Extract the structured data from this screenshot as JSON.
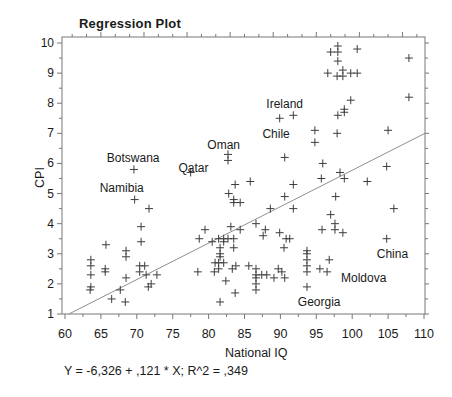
{
  "window": {
    "width": 452,
    "height": 397,
    "background": "#ffffff"
  },
  "chart_data": {
    "type": "scatter",
    "title": "Regression Plot",
    "xlabel": "National IQ",
    "ylabel": "CPI",
    "xlim": [
      60,
      110
    ],
    "ylim": [
      1,
      10
    ],
    "x_ticks": [
      60,
      65,
      70,
      75,
      80,
      85,
      90,
      95,
      100,
      105,
      110
    ],
    "y_ticks": [
      1,
      2,
      3,
      4,
      5,
      6,
      7,
      8,
      9,
      10
    ],
    "grid": false,
    "legend": "none",
    "marker": "plus",
    "colors": {
      "marker": "#3d3d3d",
      "axis": "#787878",
      "line": "#8f8f8f",
      "text": "#1a1a1a"
    },
    "regression": {
      "slope": 0.121,
      "intercept": -6.326,
      "r2": 0.349,
      "label": "Y = -6,326 + ,121 * X; R^2 = ,349"
    },
    "annotations": [
      {
        "label": "Botswana",
        "x": 69.5,
        "y": 6.17
      },
      {
        "label": "Namibia",
        "x": 67.9,
        "y": 5.17
      },
      {
        "label": "Qatar",
        "x": 77.9,
        "y": 5.85
      },
      {
        "label": "Oman",
        "x": 82.1,
        "y": 6.62
      },
      {
        "label": "Chile",
        "x": 89.4,
        "y": 6.97
      },
      {
        "label": "Ireland",
        "x": 90.6,
        "y": 7.98
      },
      {
        "label": "China",
        "x": 105.6,
        "y": 3.0
      },
      {
        "label": "Moldova",
        "x": 101.6,
        "y": 2.2
      },
      {
        "label": "Georgia",
        "x": 95.4,
        "y": 1.4
      }
    ],
    "points": [
      [
        69.6,
        5.8
      ],
      [
        69.7,
        4.8
      ],
      [
        71.7,
        4.5
      ],
      [
        70.6,
        3.9
      ],
      [
        65.7,
        3.3
      ],
      [
        70.6,
        3.4
      ],
      [
        68.5,
        3.1
      ],
      [
        68.5,
        2.9
      ],
      [
        63.6,
        2.8
      ],
      [
        63.6,
        2.6
      ],
      [
        65.6,
        2.5
      ],
      [
        65.6,
        2.4
      ],
      [
        63.6,
        2.3
      ],
      [
        63.6,
        1.9
      ],
      [
        63.5,
        1.8
      ],
      [
        68.5,
        2.2
      ],
      [
        70.4,
        2.6
      ],
      [
        71.1,
        2.6
      ],
      [
        70.4,
        2.4
      ],
      [
        71.3,
        2.3
      ],
      [
        72.0,
        2.0
      ],
      [
        72.8,
        2.3
      ],
      [
        71.6,
        1.9
      ],
      [
        67.7,
        1.8
      ],
      [
        66.5,
        1.5
      ],
      [
        68.4,
        1.4
      ],
      [
        89.9,
        7.5
      ],
      [
        91.8,
        7.6
      ],
      [
        90.6,
        6.2
      ],
      [
        82.7,
        6.3
      ],
      [
        82.7,
        6.1
      ],
      [
        77.5,
        5.7
      ],
      [
        97.0,
        9.7
      ],
      [
        98.0,
        9.9
      ],
      [
        98.0,
        9.7
      ],
      [
        98.0,
        9.4
      ],
      [
        100.7,
        9.8
      ],
      [
        107.9,
        9.5
      ],
      [
        96.6,
        9.0
      ],
      [
        97.9,
        8.9
      ],
      [
        98.7,
        9.1
      ],
      [
        98.7,
        8.9
      ],
      [
        99.8,
        9.0
      ],
      [
        100.7,
        9.0
      ],
      [
        99.8,
        8.1
      ],
      [
        107.9,
        8.2
      ],
      [
        98.9,
        7.8
      ],
      [
        98.9,
        7.7
      ],
      [
        98.0,
        7.6
      ],
      [
        94.8,
        7.1
      ],
      [
        97.9,
        7.0
      ],
      [
        105.0,
        7.1
      ],
      [
        94.8,
        6.7
      ],
      [
        95.9,
        6.0
      ],
      [
        104.8,
        5.9
      ],
      [
        98.3,
        5.7
      ],
      [
        83.7,
        5.3
      ],
      [
        85.8,
        5.4
      ],
      [
        91.8,
        5.3
      ],
      [
        82.8,
        5.0
      ],
      [
        83.5,
        4.8
      ],
      [
        83.5,
        4.7
      ],
      [
        84.4,
        4.7
      ],
      [
        88.6,
        4.5
      ],
      [
        90.6,
        4.9
      ],
      [
        91.8,
        4.5
      ],
      [
        79.5,
        3.8
      ],
      [
        78.7,
        3.5
      ],
      [
        80.5,
        3.4
      ],
      [
        83.1,
        3.9
      ],
      [
        84.4,
        3.8
      ],
      [
        86.6,
        4.0
      ],
      [
        87.9,
        3.8
      ],
      [
        89.9,
        3.7
      ],
      [
        87.6,
        3.6
      ],
      [
        81.4,
        3.5
      ],
      [
        82.1,
        3.5
      ],
      [
        82.7,
        3.5
      ],
      [
        82.1,
        3.4
      ],
      [
        83.5,
        3.5
      ],
      [
        90.8,
        3.5
      ],
      [
        91.3,
        3.5
      ],
      [
        81.6,
        3.2
      ],
      [
        83.5,
        3.2
      ],
      [
        90.5,
        3.2
      ],
      [
        81.6,
        3.0
      ],
      [
        81.6,
        2.9
      ],
      [
        80.9,
        2.7
      ],
      [
        81.4,
        2.7
      ],
      [
        81.4,
        2.5
      ],
      [
        82.1,
        2.7
      ],
      [
        78.5,
        2.4
      ],
      [
        80.8,
        2.4
      ],
      [
        83.3,
        2.5
      ],
      [
        83.8,
        2.6
      ],
      [
        85.6,
        2.6
      ],
      [
        86.6,
        2.5
      ],
      [
        86.6,
        2.3
      ],
      [
        86.6,
        2.2
      ],
      [
        86.6,
        2.0
      ],
      [
        86.6,
        1.8
      ],
      [
        87.4,
        2.3
      ],
      [
        88.1,
        2.3
      ],
      [
        89.7,
        2.5
      ],
      [
        90.2,
        2.4
      ],
      [
        89.1,
        2.2
      ],
      [
        90.6,
        2.2
      ],
      [
        82.4,
        2.1
      ],
      [
        83.7,
        1.7
      ],
      [
        81.6,
        1.4
      ],
      [
        95.7,
        5.5
      ],
      [
        98.9,
        5.5
      ],
      [
        102.1,
        5.4
      ],
      [
        97.7,
        4.9
      ],
      [
        105.8,
        4.5
      ],
      [
        97.0,
        4.3
      ],
      [
        97.6,
        4.0
      ],
      [
        97.6,
        3.8
      ],
      [
        95.8,
        3.8
      ],
      [
        98.7,
        3.7
      ],
      [
        104.8,
        3.5
      ],
      [
        93.7,
        3.1
      ],
      [
        93.7,
        3.0
      ],
      [
        93.7,
        2.8
      ],
      [
        93.7,
        2.6
      ],
      [
        96.8,
        2.8
      ],
      [
        93.7,
        2.4
      ],
      [
        95.5,
        2.5
      ],
      [
        96.5,
        2.4
      ],
      [
        93.7,
        1.9
      ]
    ]
  }
}
